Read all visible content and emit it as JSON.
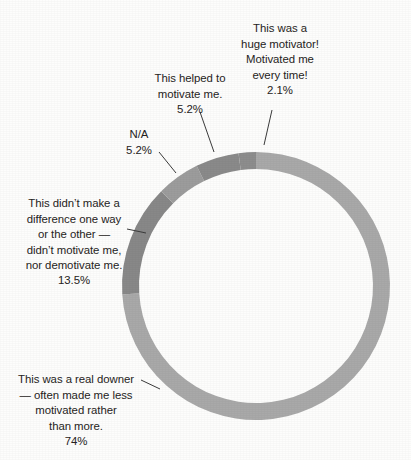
{
  "chart_data": {
    "type": "pie",
    "variant": "donut",
    "title": "",
    "subtitle": "",
    "xlabel": "",
    "ylabel": "",
    "legend_position": "none",
    "grid": false,
    "labels_outside": true,
    "leader_lines": true,
    "center": {
      "x": 256,
      "y": 286
    },
    "outer_radius": 134,
    "ring_thickness": 17,
    "start_angle_deg": 0,
    "direction": "clockwise",
    "categories": [
      "This was a real downer — often made me less motivated rather than more.",
      "This didn't make a difference one way or the other — didn't motivate me, nor demotivate me.",
      "N/A",
      "This helped to motivate me.",
      "This was a huge motivator! Motivated me every time!"
    ],
    "values": [
      74,
      13.5,
      5.2,
      5.2,
      2.1
    ],
    "value_labels": [
      "74%",
      "13.5%",
      "5.2%",
      "5.2%",
      "2.1%"
    ],
    "colors": [
      "#a9a9a9",
      "#888888",
      "#9c9c9c",
      "#8a8a8a",
      "#8d8d8d"
    ],
    "slices": [
      {
        "label": "This was a real downer — often made me less motivated rather than more.",
        "value": 74,
        "value_label": "74%",
        "color": "#a9a9a9",
        "start_deg": 0,
        "end_deg": 266.4
      },
      {
        "label": "This didn't make a difference one way or the other — didn't motivate me, nor demotivate me.",
        "value": 13.5,
        "value_label": "13.5%",
        "color": "#888888",
        "start_deg": 266.4,
        "end_deg": 315.0
      },
      {
        "label": "N/A",
        "value": 5.2,
        "value_label": "5.2%",
        "color": "#9c9c9c",
        "start_deg": 315.0,
        "end_deg": 333.7
      },
      {
        "label": "This helped to motivate me.",
        "value": 5.2,
        "value_label": "5.2%",
        "color": "#8a8a8a",
        "start_deg": 333.7,
        "end_deg": 352.5
      },
      {
        "label": "This was a huge motivator! Motivated me every time!",
        "value": 2.1,
        "value_label": "2.1%",
        "color": "#8d8d8d",
        "start_deg": 352.5,
        "end_deg": 360.0
      }
    ]
  },
  "labels": {
    "huge_motivator": {
      "text": "This was a\nhuge motivator!\nMotivated me\nevery time!",
      "pct": "2.1%"
    },
    "helped": {
      "text": "This helped to\nmotivate me.",
      "pct": "5.2%"
    },
    "na": {
      "text": "N/A",
      "pct": "5.2%"
    },
    "no_difference": {
      "text": "This didn’t make a\ndifference one way\nor the other —\ndidn’t motivate me,\nnor demotivate me.",
      "pct": "13.5%"
    },
    "downer": {
      "text": "This was a real downer\n— often made me less\nmotivated rather\nthan more.",
      "pct": "74%"
    }
  },
  "colors": {
    "background": "#fdfdfc",
    "text": "#262322",
    "leader_line": "#3b3b3b",
    "slice_light": "#a9a9a9",
    "slice_mid": "#9c9c9c",
    "slice_dark": "#888888"
  }
}
